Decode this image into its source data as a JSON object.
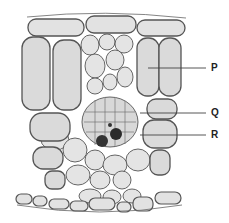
{
  "diagram": {
    "type": "leaf cross-section",
    "labels": [
      {
        "id": "P",
        "text": "P",
        "x": 212,
        "y": 64,
        "line_from": [
          148,
          68
        ],
        "line_to": [
          206,
          68
        ]
      },
      {
        "id": "Q",
        "text": "Q",
        "x": 212,
        "y": 108,
        "line_from": [
          140,
          113
        ],
        "line_to": [
          206,
          113
        ]
      },
      {
        "id": "R",
        "text": "R",
        "x": 212,
        "y": 130,
        "line_from": [
          140,
          135
        ],
        "line_to": [
          206,
          135
        ]
      }
    ],
    "colors": {
      "cell_fill": "#dcdcdc",
      "cell_stroke": "#555555",
      "chloroplast": "#444444",
      "vascular_dark": "#2a2a2a",
      "background": "#ffffff"
    }
  }
}
